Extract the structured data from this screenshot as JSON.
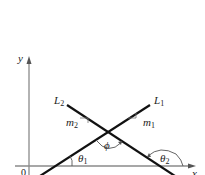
{
  "diagram": {
    "axes": {
      "x_label": "x",
      "y_label": "y",
      "origin_label": "0"
    },
    "lines": [
      {
        "name": "L",
        "sub": "1",
        "slope_label": "m",
        "slope_sub": "1",
        "angle_label": "θ",
        "angle_sub": "1"
      },
      {
        "name": "L",
        "sub": "2",
        "slope_label": "m",
        "slope_sub": "2",
        "angle_label": "θ",
        "angle_sub": "2"
      }
    ],
    "intersection_angle_label": "ϕ",
    "colors": {
      "lines": "#111111",
      "axes": "#888888",
      "text": "#222222"
    }
  }
}
